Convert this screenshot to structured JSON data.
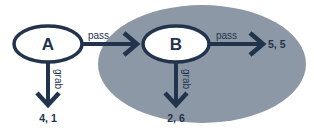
{
  "colors": {
    "ink": "#22334d",
    "shade": "#8c98a5",
    "node_fill": "#ffffff",
    "background": "#ffffff"
  },
  "nodes": [
    {
      "id": "A",
      "label": "A"
    },
    {
      "id": "B",
      "label": "B"
    }
  ],
  "edges": [
    {
      "from": "A",
      "to": "B",
      "label": "pass"
    },
    {
      "from": "A",
      "to": "payoff_A_grab",
      "label": "grab"
    },
    {
      "from": "B",
      "to": "payoff_B_pass",
      "label": "pass"
    },
    {
      "from": "B",
      "to": "payoff_B_grab",
      "label": "grab"
    }
  ],
  "payoffs": {
    "a_grab": "4, 1",
    "b_grab": "2, 6",
    "b_pass": "5, 5"
  },
  "subgame_region": {
    "description": "shaded ellipse enclosing node B subgame"
  }
}
